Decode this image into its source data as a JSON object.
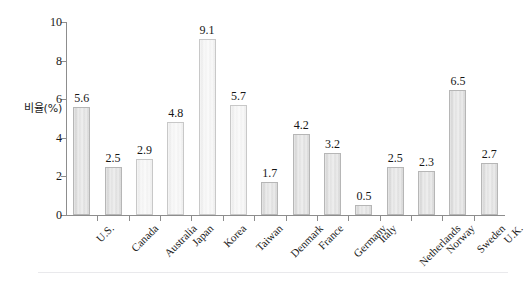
{
  "chart_data": {
    "type": "bar",
    "title": "",
    "xlabel": "",
    "ylabel": "비율(%)",
    "ylim": [
      0,
      10
    ],
    "yticks": [
      "0",
      "2",
      "4",
      "6",
      "8",
      "10"
    ],
    "grid": false,
    "legend": false,
    "categories": [
      "U.S.",
      "Canada",
      "Australia",
      "Japan",
      "Korea",
      "Taiwan",
      "Denmark",
      "France",
      "Germany",
      "Italy",
      "Netherlands",
      "Norway",
      "Sweden",
      "U.K."
    ],
    "values": [
      5.6,
      2.5,
      2.9,
      4.8,
      9.1,
      5.7,
      1.7,
      4.2,
      3.2,
      0.5,
      2.5,
      2.3,
      6.5,
      2.7
    ],
    "value_labels": [
      "5.6",
      "2.5",
      "2.9",
      "4.8",
      "9.1",
      "5.7",
      "1.7",
      "4.2",
      "3.2",
      "0.5",
      "2.5",
      "2.3",
      "6.5",
      "2.7"
    ],
    "bar_color": "#e0e0e0",
    "bar_edge_color": "#b6b6b6",
    "axis_color": "#8d8d8d",
    "text_color": "#1a1a1a"
  }
}
